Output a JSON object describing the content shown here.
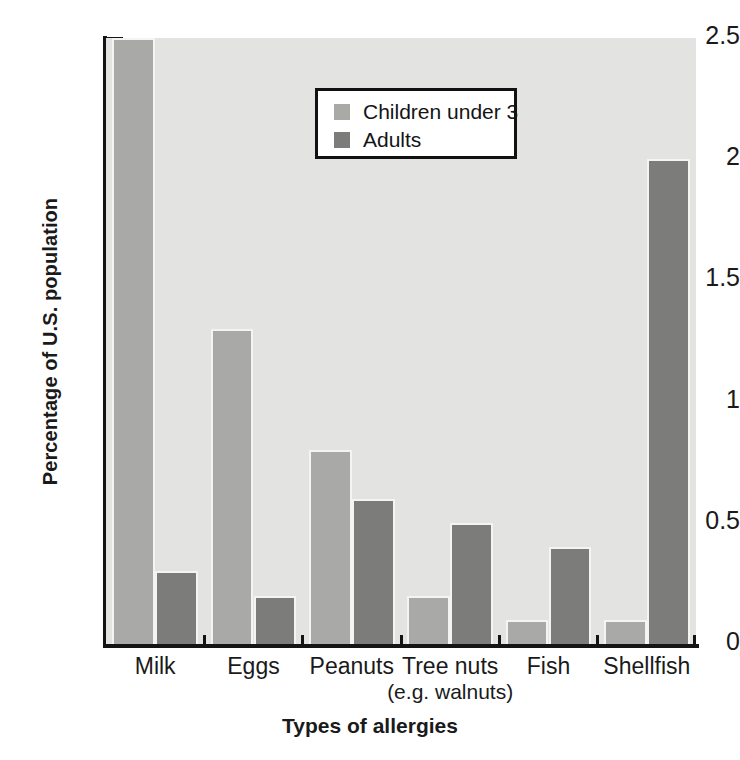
{
  "chart_data": {
    "type": "bar",
    "title": "",
    "xlabel": "Types of allergies",
    "ylabel": "Percentage of U.S. population",
    "categories": [
      "Milk",
      "Eggs",
      "Peanuts",
      "Tree nuts",
      "Fish",
      "Shellfish"
    ],
    "category_sublabels": [
      "",
      "",
      "",
      "(e.g. walnuts)",
      "",
      ""
    ],
    "series": [
      {
        "name": "Children under 3",
        "color": "#a9a9a7",
        "values": [
          2.5,
          1.3,
          0.8,
          0.2,
          0.1,
          0.1
        ]
      },
      {
        "name": "Adults",
        "color": "#7c7c7a",
        "values": [
          0.3,
          0.2,
          0.6,
          0.5,
          0.4,
          2.0
        ]
      }
    ],
    "ylim": [
      0,
      2.5
    ],
    "ytick_labels": [
      "0",
      "0.5",
      "1",
      "1.5",
      "2",
      "2.5"
    ],
    "ytick_values": [
      0,
      0.5,
      1,
      1.5,
      2,
      2.5
    ],
    "yminor_step": 0.1,
    "grid": false,
    "legend_position": "top-center",
    "plot_background": "#e3e3e1",
    "axis_color": "#141414"
  },
  "legend": {
    "entries": [
      {
        "label": "Children under 3",
        "swatch": "children"
      },
      {
        "label": "Adults",
        "swatch": "adults"
      }
    ]
  }
}
